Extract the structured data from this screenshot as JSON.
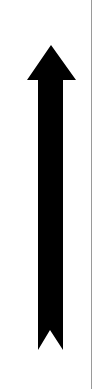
{
  "graphic": {
    "name": "up-arrow",
    "direction": "up",
    "fill_color": "#000000",
    "background_color": "#ffffff",
    "edge_line_color": "#9a9a9a"
  }
}
